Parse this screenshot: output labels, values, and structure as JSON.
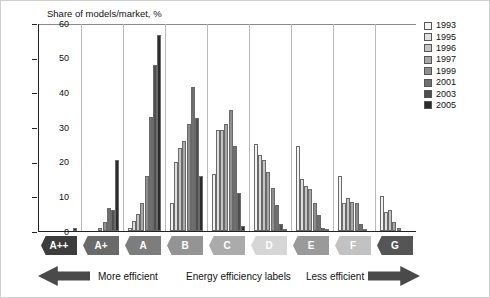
{
  "chart_data": {
    "type": "bar",
    "title": "",
    "ylabel": "Share of models/market, %",
    "xlabel": "Energy efficiency labels",
    "ylim": [
      0,
      60
    ],
    "yticks": [
      0,
      10,
      20,
      30,
      40,
      50,
      60
    ],
    "grid": "vertical",
    "legend_position": "right",
    "categories": [
      "A++",
      "A+",
      "A",
      "B",
      "C",
      "D",
      "E",
      "F",
      "G"
    ],
    "series": [
      {
        "name": "1993",
        "color": "#f2f2f2",
        "values": [
          0,
          0,
          1.0,
          8.0,
          16.5,
          25.0,
          24.5,
          16.0,
          10.0
        ]
      },
      {
        "name": "1995",
        "color": "#dedede",
        "values": [
          0,
          0,
          3.0,
          20.0,
          29.0,
          22.0,
          15.0,
          8.0,
          5.5
        ]
      },
      {
        "name": "1996",
        "color": "#c4c4c4",
        "values": [
          0,
          0,
          5.0,
          24.0,
          29.0,
          20.5,
          13.0,
          9.5,
          6.0
        ]
      },
      {
        "name": "1997",
        "color": "#a8a8a8",
        "values": [
          0,
          1.0,
          8.0,
          26.0,
          31.0,
          17.0,
          12.0,
          8.5,
          2.5
        ]
      },
      {
        "name": "1999",
        "color": "#8e8e8e",
        "values": [
          0,
          2.5,
          16.0,
          31.0,
          35.0,
          12.5,
          8.0,
          8.0,
          1.0
        ]
      },
      {
        "name": "2001",
        "color": "#6f6f6f",
        "values": [
          0,
          6.5,
          33.0,
          41.5,
          24.5,
          7.5,
          4.5,
          2.0,
          0.0
        ]
      },
      {
        "name": "2003",
        "color": "#4f4f4f",
        "values": [
          0,
          6.0,
          48.0,
          32.5,
          11.0,
          2.0,
          1.0,
          0.5,
          0.0
        ]
      },
      {
        "name": "2005",
        "color": "#2b2b2b",
        "values": [
          1.0,
          20.5,
          56.5,
          16.0,
          1.5,
          0.5,
          0.5,
          0.0,
          0.0
        ]
      }
    ]
  },
  "legend": {
    "items": [
      {
        "label": "1993",
        "swatch": "#f2f2f2"
      },
      {
        "label": "1995",
        "swatch": "#dedede"
      },
      {
        "label": "1996",
        "swatch": "#c4c4c4"
      },
      {
        "label": "1997",
        "swatch": "#a8a8a8"
      },
      {
        "label": "1999",
        "swatch": "#8e8e8e"
      },
      {
        "label": "2001",
        "swatch": "#6f6f6f"
      },
      {
        "label": "2003",
        "swatch": "#4f4f4f"
      },
      {
        "label": "2005",
        "swatch": "#2b2b2b"
      }
    ]
  },
  "badges": [
    {
      "label": "A++",
      "fill": "#3d3d3d",
      "text": "#ffffff"
    },
    {
      "label": "A+",
      "fill": "#6a6a6a",
      "text": "#ffffff"
    },
    {
      "label": "A",
      "fill": "#7d7d7d",
      "text": "#ffffff"
    },
    {
      "label": "B",
      "fill": "#949494",
      "text": "#ffffff"
    },
    {
      "label": "C",
      "fill": "#ababab",
      "text": "#ffffff"
    },
    {
      "label": "D",
      "fill": "#d6d6d6",
      "text": "#ffffff"
    },
    {
      "label": "E",
      "fill": "#9a9a9a",
      "text": "#ffffff"
    },
    {
      "label": "F",
      "fill": "#c2c2c2",
      "text": "#ffffff"
    },
    {
      "label": "G",
      "fill": "#555555",
      "text": "#ffffff"
    }
  ],
  "captions": {
    "more_efficient": "More efficient",
    "axis_title": "Energy efficiency labels",
    "less_efficient": "Less efficient",
    "arrow_left_name": "left-arrow-icon",
    "arrow_right_name": "right-arrow-icon",
    "arrow_color": "#4a4a4a"
  }
}
